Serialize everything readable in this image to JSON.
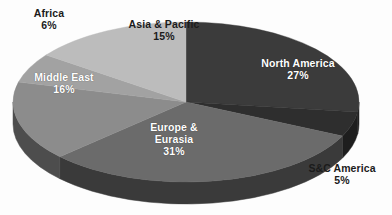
{
  "chart_data": {
    "type": "pie",
    "title": "",
    "subtitle": "",
    "xlabel": "",
    "ylabel": "",
    "legend_position": "none",
    "grid": false,
    "style": "3d-pie",
    "unit": "%",
    "categories": [
      "North America",
      "S&C America",
      "Europe & Eurasia",
      "Middle East",
      "Africa",
      "Asia & Pacific"
    ],
    "values": [
      27,
      5,
      31,
      16,
      6,
      15
    ],
    "slices": [
      {
        "id": "north-america",
        "label": "North America",
        "value_label": "27%",
        "value": 27,
        "color": "#3b3b3b",
        "side_color": "#242424",
        "label_placement": "inside",
        "label_color": "#ffffff"
      },
      {
        "id": "sc-america",
        "label": "S&C America",
        "value_label": "5%",
        "value": 5,
        "color": "#2e2e2e",
        "side_color": "#1e1e1e",
        "label_placement": "outside",
        "label_color": "#1b1b1b"
      },
      {
        "id": "europe-eurasia",
        "label": "Europe & Eurasia",
        "label_line1": "Europe &",
        "label_line2": "Eurasia",
        "value_label": "31%",
        "value": 31,
        "color": "#6b6b6b",
        "side_color": "#3a3a3a",
        "label_placement": "inside",
        "label_color": "#ffffff"
      },
      {
        "id": "middle-east",
        "label": "Middle East",
        "value_label": "16%",
        "value": 16,
        "color": "#8c8c8c",
        "side_color": "#4d4d4d",
        "label_placement": "inside",
        "label_color": "#ffffff"
      },
      {
        "id": "africa",
        "label": "Africa",
        "value_label": "6%",
        "value": 6,
        "color": "#a2a2a2",
        "side_color": "#5a5a5a",
        "label_placement": "outside",
        "label_color": "#1b1b1b"
      },
      {
        "id": "asia-pacific",
        "label": "Asia & Pacific",
        "value_label": "15%",
        "value": 15,
        "color": "#bcbcbc",
        "side_color": "#686868",
        "label_placement": "inside",
        "label_color": "#1b1b1b"
      }
    ],
    "colors": {
      "background": "#fdfdfd",
      "text_dark": "#1b1b1b",
      "text_light": "#ffffff"
    }
  }
}
